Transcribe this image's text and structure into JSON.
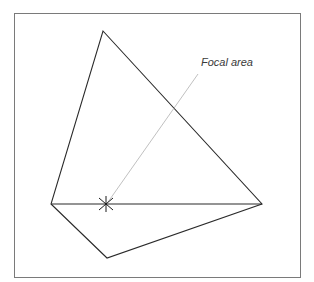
{
  "diagram": {
    "title": "",
    "frame": {
      "x": 14,
      "y": 13,
      "width": 286,
      "height": 264,
      "stroke": "#7a7a7a"
    },
    "shape": {
      "vertices": {
        "top": [
          103,
          31
        ],
        "right": [
          262,
          204
        ],
        "bottom": [
          107,
          258
        ],
        "left": [
          51,
          204
        ]
      },
      "stroke": "#2a2a2a"
    },
    "baseline": {
      "from": [
        51,
        204
      ],
      "to": [
        262,
        204
      ]
    },
    "focal_point": {
      "x": 106,
      "y": 204,
      "marker": "asterisk"
    },
    "leader_line": {
      "from": [
        198,
        74
      ],
      "to": [
        108,
        202
      ],
      "stroke": "#b0b0b0"
    },
    "annotations": [
      {
        "id": "focal-area",
        "text": "Focal area",
        "x": 201,
        "y": 61
      }
    ]
  }
}
